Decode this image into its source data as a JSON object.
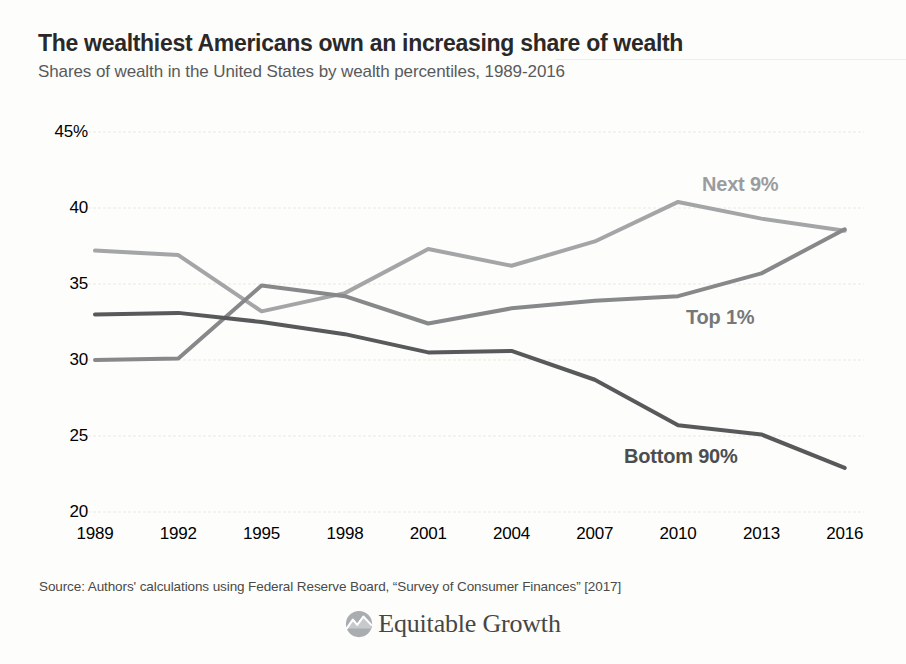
{
  "header": {
    "title": "The wealthiest Americans own an increasing share of wealth",
    "subtitle": "Shares of wealth in the United States by wealth percentiles, 1989-2016"
  },
  "footer": {
    "source": "Source: Authors' calculations using Federal Reserve Board, “Survey of Consumer Finances” [2017]",
    "logo": {
      "text": "Equitable Growth",
      "icon": "mountain-line-chart-icon"
    }
  },
  "colors": {
    "title": "#2b2828",
    "subtitle": "#595a5c",
    "axis-label": "#6d6e71",
    "grid": "#e9e9e6",
    "next9": "#a4a5a7",
    "top1": "#87888a",
    "bottom90": "#58595b",
    "next9-label": "#9b9c9e",
    "top1-label": "#76777a",
    "bottom90-label": "#4c4d4f",
    "logo-gray": "#a9adb0",
    "logo-text": "#474645"
  },
  "chart_data": {
    "type": "line",
    "title": "The wealthiest Americans own an increasing share of wealth",
    "subtitle": "Shares of wealth in the United States by wealth percentiles, 1989-2016",
    "x": [
      1989,
      1992,
      1995,
      1998,
      2001,
      2004,
      2007,
      2010,
      2013,
      2016
    ],
    "xlabel": "",
    "ylabel": "",
    "ylim": [
      20,
      45
    ],
    "yticks": [
      45,
      40,
      35,
      30,
      25,
      20
    ],
    "ytick_labels": [
      "45%",
      "40",
      "35",
      "30",
      "25",
      "20"
    ],
    "grid": "horizontal",
    "legend_position": "inline-labels",
    "series": [
      {
        "name": "Next 9%",
        "color_key": "next9",
        "values": [
          37.2,
          36.9,
          33.2,
          34.4,
          37.3,
          36.2,
          37.8,
          40.4,
          39.3,
          38.5
        ]
      },
      {
        "name": "Top 1%",
        "color_key": "top1",
        "values": [
          30.0,
          30.1,
          34.9,
          34.2,
          32.4,
          33.4,
          33.9,
          34.2,
          35.7,
          38.6
        ]
      },
      {
        "name": "Bottom 90%",
        "color_key": "bottom90",
        "values": [
          33.0,
          33.1,
          32.5,
          31.7,
          30.5,
          30.6,
          28.7,
          25.7,
          25.1,
          22.9
        ]
      }
    ]
  }
}
